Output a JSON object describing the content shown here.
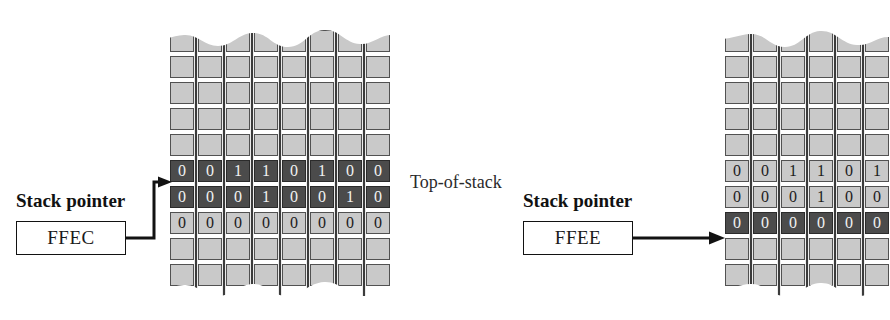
{
  "figure": {
    "type": "stack-pointer-memory-diagram",
    "bits_per_word": 8,
    "colors": {
      "highlight_cell": "#4b4b4b",
      "normal_cell": "#c9c9c9",
      "cell_border": "#4e4e4e",
      "highlight_text": "#f2f2f2",
      "normal_text": "#1c1c1c",
      "background": "#ffffff",
      "line": "#121212"
    }
  },
  "panels": [
    {
      "id": "before",
      "pointer_label": "Stack pointer",
      "pointer_value": "FFEC",
      "annotation": "Top-of-stack",
      "arrow_style": "elbow",
      "rows": [
        {
          "kind": "partial-top",
          "shade": "light",
          "bits": [
            "",
            "",
            "",
            "",
            "",
            "",
            "",
            ""
          ]
        },
        {
          "kind": "empty",
          "shade": "light",
          "bits": [
            "",
            "",
            "",
            "",
            "",
            "",
            "",
            ""
          ]
        },
        {
          "kind": "empty",
          "shade": "light",
          "bits": [
            "",
            "",
            "",
            "",
            "",
            "",
            "",
            ""
          ]
        },
        {
          "kind": "empty",
          "shade": "light",
          "bits": [
            "",
            "",
            "",
            "",
            "",
            "",
            "",
            ""
          ]
        },
        {
          "kind": "empty",
          "shade": "light",
          "bits": [
            "",
            "",
            "",
            "",
            "",
            "",
            "",
            ""
          ]
        },
        {
          "kind": "data",
          "shade": "dark",
          "bits": [
            "0",
            "0",
            "1",
            "1",
            "0",
            "1",
            "0",
            "0"
          ]
        },
        {
          "kind": "data",
          "shade": "dark",
          "bits": [
            "0",
            "0",
            "0",
            "1",
            "0",
            "0",
            "1",
            "0"
          ]
        },
        {
          "kind": "data",
          "shade": "light",
          "bits": [
            "0",
            "0",
            "0",
            "0",
            "0",
            "0",
            "0",
            "0"
          ]
        },
        {
          "kind": "empty",
          "shade": "light",
          "bits": [
            "",
            "",
            "",
            "",
            "",
            "",
            "",
            ""
          ]
        },
        {
          "kind": "partial-bottom",
          "shade": "light",
          "bits": [
            "",
            "",
            "",
            "",
            "",
            "",
            "",
            ""
          ]
        }
      ],
      "pointer_target_row": 5
    },
    {
      "id": "after",
      "pointer_label": "Stack pointer",
      "pointer_value": "FFEE",
      "annotation": "",
      "arrow_style": "straight",
      "rows": [
        {
          "kind": "partial-top",
          "shade": "light",
          "bits": [
            "",
            "",
            "",
            "",
            "",
            "",
            "",
            ""
          ]
        },
        {
          "kind": "empty",
          "shade": "light",
          "bits": [
            "",
            "",
            "",
            "",
            "",
            "",
            "",
            ""
          ]
        },
        {
          "kind": "empty",
          "shade": "light",
          "bits": [
            "",
            "",
            "",
            "",
            "",
            "",
            "",
            ""
          ]
        },
        {
          "kind": "empty",
          "shade": "light",
          "bits": [
            "",
            "",
            "",
            "",
            "",
            "",
            "",
            ""
          ]
        },
        {
          "kind": "empty",
          "shade": "light",
          "bits": [
            "",
            "",
            "",
            "",
            "",
            "",
            "",
            ""
          ]
        },
        {
          "kind": "data",
          "shade": "light",
          "bits": [
            "0",
            "0",
            "1",
            "1",
            "0",
            "1",
            "0",
            "0"
          ]
        },
        {
          "kind": "data",
          "shade": "light",
          "bits": [
            "0",
            "0",
            "0",
            "1",
            "0",
            "0",
            "1",
            "0"
          ]
        },
        {
          "kind": "data",
          "shade": "dark",
          "bits": [
            "0",
            "0",
            "0",
            "0",
            "0",
            "0",
            "0",
            "0"
          ]
        },
        {
          "kind": "empty",
          "shade": "light",
          "bits": [
            "",
            "",
            "",
            "",
            "",
            "",
            "",
            ""
          ]
        },
        {
          "kind": "partial-bottom",
          "shade": "light",
          "bits": [
            "",
            "",
            "",
            "",
            "",
            "",
            "",
            ""
          ]
        }
      ],
      "pointer_target_row": 7
    }
  ]
}
